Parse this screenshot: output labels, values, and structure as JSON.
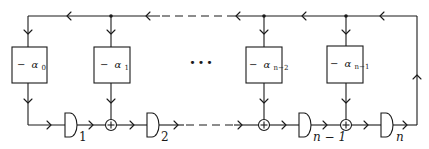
{
  "diagram": {
    "title": "",
    "type": "linear feedback shift register (recurrence circuit)",
    "coefficients": [
      {
        "sign": "−",
        "symbol": "α",
        "subscript": "0"
      },
      {
        "sign": "−",
        "symbol": "α",
        "subscript": "1"
      },
      {
        "sign": "−",
        "symbol": "α",
        "subscript": "n−2"
      },
      {
        "sign": "−",
        "symbol": "α",
        "subscript": "n−1"
      }
    ],
    "delays": [
      {
        "label": "1"
      },
      {
        "label": "2"
      },
      {
        "label": "n − 1"
      },
      {
        "label": "n"
      }
    ],
    "ellipsis": "•••",
    "adders": 3,
    "feedback_junctions": 3,
    "icons": {
      "delay": "delay-element-icon",
      "adder": "adder-circle-plus-icon",
      "arrow": "chevron-arrow-icon",
      "junction": "junction-dot-icon"
    },
    "colors": {
      "stroke": "#1a1a1a",
      "background": "#ffffff"
    }
  }
}
